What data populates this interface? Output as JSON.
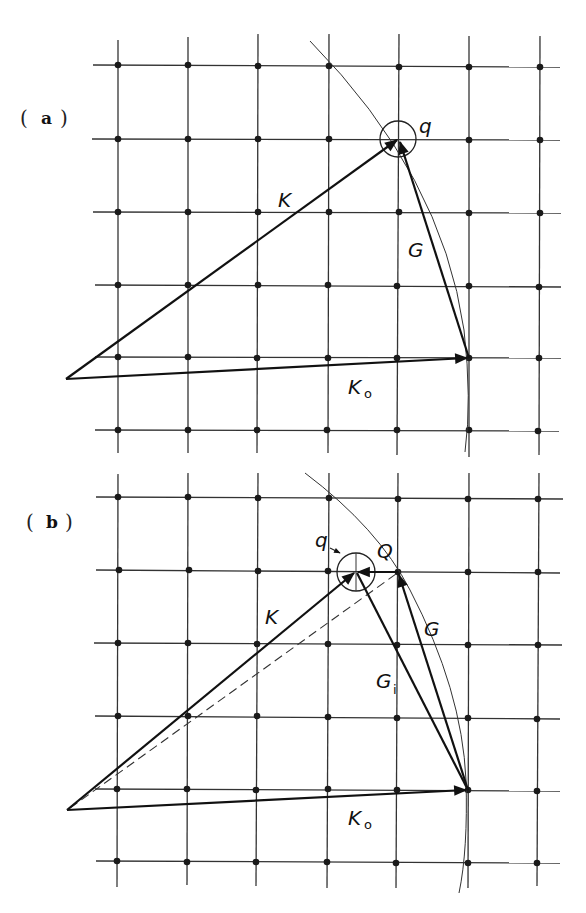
{
  "panels": [
    {
      "id": "a",
      "label_text": "a",
      "grid": {
        "x": [
          118,
          188,
          258,
          329,
          399,
          469,
          540
        ],
        "y": [
          65,
          139,
          212,
          285,
          358,
          430
        ]
      },
      "origin": [
        66,
        379
      ],
      "labels": {
        "K": "K",
        "G": "G",
        "K0_main": "K",
        "K0_sub": "o",
        "q": "q"
      },
      "points": {
        "K_end": [
          399,
          139
        ],
        "K0_end": [
          469,
          358
        ]
      }
    },
    {
      "id": "b",
      "label_text": "b",
      "grid": {
        "x": [
          118,
          188,
          258,
          329,
          398,
          469,
          540
        ],
        "y": [
          497,
          570,
          643,
          716,
          790,
          862
        ]
      },
      "origin": [
        67,
        810
      ],
      "labels": {
        "K": "K",
        "G": "G",
        "Gi_main": "G",
        "Gi_sub": "i",
        "K0_main": "K",
        "K0_sub": "o",
        "q": "q",
        "Q": "Q"
      },
      "points": {
        "K_end": [
          356,
          572
        ],
        "Q": [
          398,
          572
        ],
        "K0_end": [
          469,
          790
        ]
      }
    }
  ],
  "colors": {
    "ink": "#111111",
    "background": "#ffffff"
  }
}
